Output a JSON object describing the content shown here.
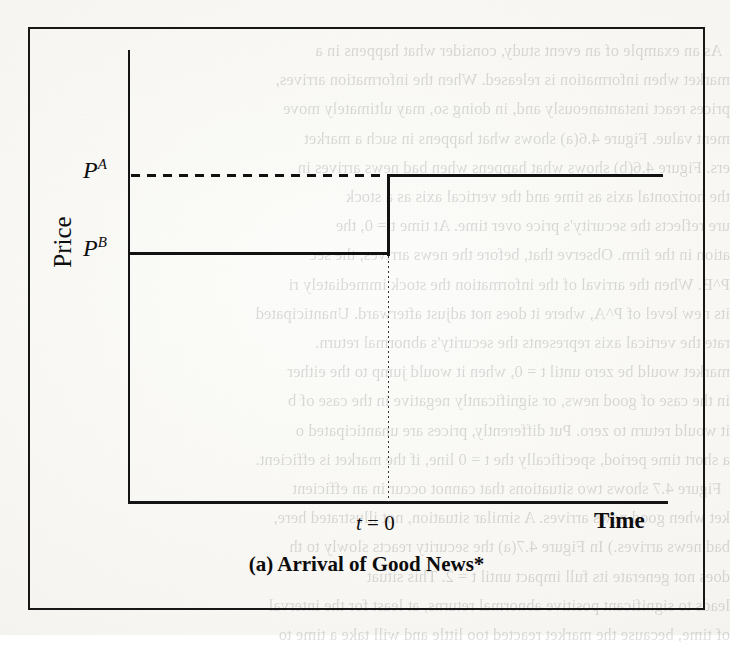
{
  "figure": {
    "caption": "(a) Arrival of Good News*",
    "axes": {
      "y_label": "Price",
      "x_label": "Time",
      "event_marker": "t = 0",
      "event_marker_var": "t",
      "event_marker_eq": " = 0"
    },
    "price_labels": {
      "high_base": "P",
      "high_sup": "A",
      "low_base": "P",
      "low_sup": "B"
    },
    "colors": {
      "ink": "#121212",
      "frame": "#171717",
      "paper": "#f7f6f2"
    }
  },
  "chart_data": {
    "type": "line",
    "title": "(a) Arrival of Good News*",
    "xlabel": "Time",
    "ylabel": "Price",
    "x": [
      -1.0,
      0.0,
      0.0,
      1.15
    ],
    "y": [
      "P^B",
      "P^B",
      "P^A",
      "P^A"
    ],
    "series": [
      {
        "name": "Actual price path (efficient market)",
        "style": "solid",
        "points": [
          {
            "t": -1.0,
            "price_label": "P^B",
            "price_level": 0.32
          },
          {
            "t": 0.0,
            "price_label": "P^B",
            "price_level": 0.32
          },
          {
            "t": 0.0,
            "price_label": "P^A",
            "price_level": 0.72
          },
          {
            "t": 1.15,
            "price_label": "P^A",
            "price_level": 0.72
          }
        ]
      },
      {
        "name": "P^A reference level",
        "style": "dashed",
        "points": [
          {
            "t": -1.0,
            "price_label": "P^A",
            "price_level": 0.72
          },
          {
            "t": 0.0,
            "price_label": "P^A",
            "price_level": 0.72
          }
        ]
      },
      {
        "name": "t = 0 event line",
        "style": "dotted-vertical",
        "points": [
          {
            "t": 0.0,
            "price_label": "P^B",
            "price_level": 0.32
          },
          {
            "t": 0.0,
            "price_label": "0",
            "price_level": 0.0
          }
        ]
      }
    ],
    "annotations": [
      {
        "text": "P^A",
        "position": "y-axis tick, upper"
      },
      {
        "text": "P^B",
        "position": "y-axis tick, lower"
      },
      {
        "text": "t = 0",
        "position": "x-axis, at event time"
      }
    ],
    "ylim": [
      "0",
      "above P^A"
    ],
    "xlim": [
      "before news",
      "after news"
    ],
    "grid": false,
    "legend": "none"
  },
  "bleed_through_text": "  As an example of an event study, consider what happens in a\nmarket when information is released. When the information arrives,\nprices react instantaneously and, in doing so, may ultimately move\nment value. Figure 4.6(a) shows what happens in such a market\ners. Figure 4.6(b) shows what happens when bad news arrives in\nthe horizontal axis as time and the vertical axis as a stock\nure reflects the security's price over time. At time t = 0, the\nation in the firm. Observe that, before the news arrives, the sec\nP^B. When the arrival of the information the stock immediately ri\nits new level of P^A, where it does not adjust afterward. Unanticipated\nrate the vertical axis represents the security's abnormal return.\nmarket would be zero until t = 0, when it would jump to the either\nin the case of good news, or significantly negative in the case of b\nit would return to zero. Put differently, prices are unanticipated o\na short time period, specifically the t = 0 line, if the market is efficient.\n  Figure 4.7 shows two situations that cannot occur in an efficient\nket when good news arrives. A similar situation, not illustrated here,\nbad news arrives.) In Figure 4.7(a) the security reacts slowly to th\ndoes not generate its full impact until t = 2. This situat\nleads to significant positive abnormal returns, at least for the interval\nof time, because the market reacted too little and will take a time to"
}
